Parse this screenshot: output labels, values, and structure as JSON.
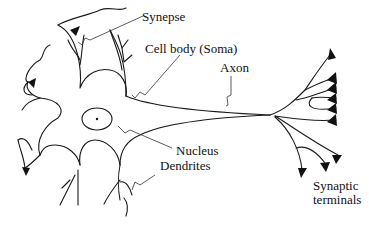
{
  "diagram": {
    "labels": {
      "synapse": "Synepse",
      "cell_body": "Cell body (Soma)",
      "axon": "Axon",
      "nucleus": "Nucleus",
      "dendrites": "Dendrites",
      "synaptic_terminals_line1": "Synaptic",
      "synaptic_terminals_line2": "terminals"
    },
    "colors": {
      "line": "#1a1a1a",
      "background": "#ffffff"
    }
  }
}
